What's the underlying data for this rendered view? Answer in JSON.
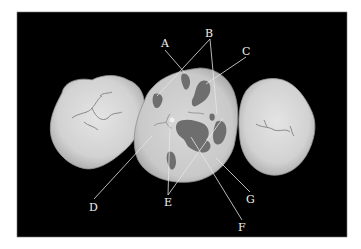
{
  "figure": {
    "background_color": "#000000",
    "tooth_color": "#d9d9d9",
    "lesion_color": "#6e6e6e",
    "labels": [
      {
        "id": "A",
        "text": "A"
      },
      {
        "id": "B",
        "text": "B"
      },
      {
        "id": "C",
        "text": "C"
      },
      {
        "id": "D",
        "text": "D"
      },
      {
        "id": "E",
        "text": "E"
      },
      {
        "id": "F",
        "text": "F"
      },
      {
        "id": "G",
        "text": "G"
      }
    ]
  }
}
